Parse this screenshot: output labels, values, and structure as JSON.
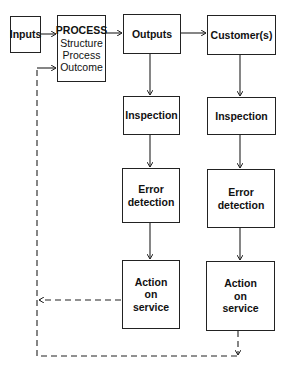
{
  "diagram": {
    "nodes": {
      "inputs": {
        "label": "Inputs"
      },
      "process": {
        "label": "PROCESS",
        "items": [
          "Structure",
          "Process",
          "Outcome"
        ]
      },
      "outputs": {
        "label": "Outputs"
      },
      "customers": {
        "label": "Customer(s)"
      },
      "inspection_outputs": {
        "label": "Inspection"
      },
      "inspection_customers": {
        "label": "Inspection"
      },
      "error_outputs": {
        "line1": "Error",
        "line2": "detection"
      },
      "error_customers": {
        "line1": "Error",
        "line2": "detection"
      },
      "action_outputs": {
        "line1": "Action",
        "line2": "on",
        "line3": "service"
      },
      "action_customers": {
        "line1": "Action",
        "line2": "on",
        "line3": "service"
      }
    },
    "edges": [
      {
        "from": "inputs",
        "to": "process",
        "style": "solid"
      },
      {
        "from": "process",
        "to": "outputs",
        "style": "solid"
      },
      {
        "from": "outputs",
        "to": "customers",
        "style": "solid"
      },
      {
        "from": "outputs",
        "to": "inspection_outputs",
        "style": "solid"
      },
      {
        "from": "inspection_outputs",
        "to": "error_outputs",
        "style": "solid"
      },
      {
        "from": "error_outputs",
        "to": "action_outputs",
        "style": "solid"
      },
      {
        "from": "customers",
        "to": "inspection_customers",
        "style": "solid"
      },
      {
        "from": "inspection_customers",
        "to": "error_customers",
        "style": "solid"
      },
      {
        "from": "error_customers",
        "to": "action_customers",
        "style": "solid"
      },
      {
        "from": "action_outputs",
        "to": "process",
        "style": "dashed",
        "label": "feedback"
      },
      {
        "from": "action_customers",
        "to": "process",
        "style": "dashed",
        "label": "feedback"
      }
    ],
    "colors": {
      "line": "#222222",
      "background": "#ffffff"
    }
  }
}
